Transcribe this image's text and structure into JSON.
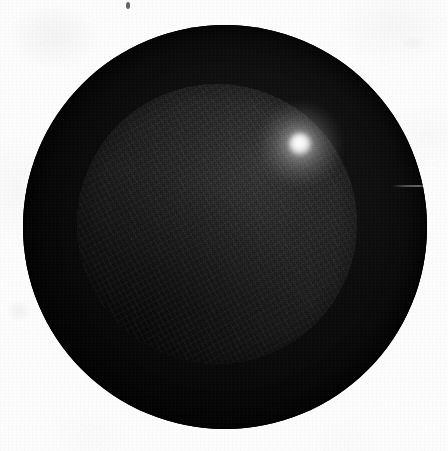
{
  "figure": {
    "label": "photographic plate of a dark sphere",
    "medium": "grayscale film scan",
    "width": 448,
    "height": 451,
    "background_color": "#fdfdfd"
  },
  "subject": {
    "name": "dark sphere",
    "description": "black spherical object with a shallow lit dome face and a single specular highlight",
    "outer_circle": {
      "name": "outer-rim",
      "center_x": 225,
      "center_y": 227,
      "radius": 202,
      "fill_color": "#070707",
      "edge_color": "#040404"
    },
    "inner_dome": {
      "name": "inner-dome",
      "center_x": 217,
      "center_y": 224,
      "radius": 140,
      "fill_color": "#232323",
      "bright_color": "#3a3a3a",
      "shadow_color": "#0b0b0b"
    },
    "specular_highlight": {
      "name": "specular-highlight",
      "center_x": 300,
      "center_y": 144,
      "core_radius": 11,
      "glow_radius": 40,
      "core_color": "#ffffff",
      "glow_color": "#f0f0f0"
    }
  },
  "artifacts": [
    {
      "name": "dust-speck",
      "x": 126,
      "y": 2,
      "width": 4,
      "height": 7,
      "color": "#4a4a50"
    },
    {
      "name": "emulsion-scratch",
      "x": 392,
      "y": 185,
      "width": 44,
      "height": 2
    },
    {
      "name": "paper-wisp-left",
      "x": 6,
      "y": 300,
      "width": 26,
      "height": 22
    },
    {
      "name": "paper-wisp-top-right",
      "x": 402,
      "y": 36,
      "width": 22,
      "height": 14
    }
  ],
  "tone_scale": {
    "paper_white": "#fdfdfd",
    "rim_black": "#070707",
    "dome_mid_gray": "#232323",
    "highlight_white": "#ffffff"
  }
}
